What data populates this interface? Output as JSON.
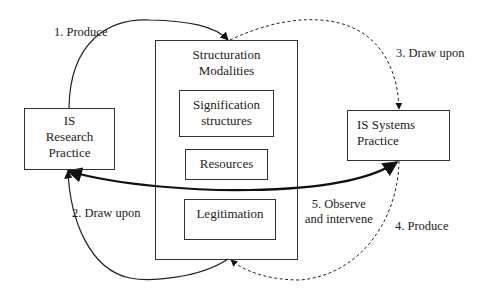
{
  "diagram": {
    "nodes": {
      "research_practice": {
        "lines": [
          "IS",
          "Research",
          "Practice"
        ]
      },
      "systems_practice": {
        "lines": [
          "IS Systems",
          "Practice"
        ]
      },
      "structuration": {
        "title_lines": [
          "Structuration",
          "Modalities"
        ],
        "children": {
          "signification": {
            "lines": [
              "Signification",
              "structures"
            ]
          },
          "resources": {
            "label": "Resources"
          },
          "legitimation": {
            "label": "Legitimation"
          }
        }
      }
    },
    "edges": [
      {
        "id": 1,
        "label": "1. Produce",
        "from": "IS Research Practice",
        "to": "Structuration Modalities",
        "style": "solid"
      },
      {
        "id": 2,
        "label": "2. Draw upon",
        "from": "Structuration Modalities",
        "to": "IS Research Practice",
        "style": "solid"
      },
      {
        "id": 3,
        "label": "3. Draw upon",
        "from": "Structuration Modalities",
        "to": "IS Systems Practice",
        "style": "dashed"
      },
      {
        "id": 4,
        "label": "4. Produce",
        "from": "IS Systems Practice",
        "to": "Structuration Modalities",
        "style": "dashed"
      },
      {
        "id": 5,
        "label_lines": [
          "5. Observe",
          "and intervene"
        ],
        "between": [
          "IS Research Practice",
          "IS Systems Practice"
        ],
        "style": "solid-bold-bidirectional"
      }
    ]
  }
}
